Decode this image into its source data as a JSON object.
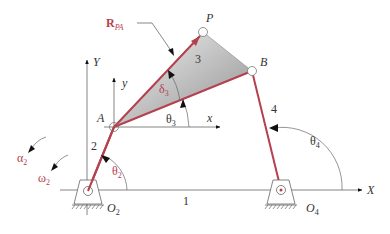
{
  "diagram": {
    "title": "",
    "type": "four-bar linkage with coupler point",
    "colors": {
      "link": "#b5404e",
      "axis": "#555555",
      "coupler_fill_light": "#f2f2f2",
      "coupler_fill_dark": "#9a9a9a",
      "label_dark": "#333333",
      "label_red": "#b5404e"
    },
    "points": {
      "P": {
        "label": "P",
        "x": 203,
        "y": 32
      },
      "B": {
        "label": "B",
        "x": 252,
        "y": 71
      },
      "A": {
        "label": "A",
        "x": 114,
        "y": 127
      },
      "O2": {
        "label": "O",
        "sub": "2",
        "x": 88,
        "y": 191
      },
      "O4": {
        "label": "O",
        "sub": "4",
        "x": 281,
        "y": 190
      }
    },
    "links": {
      "ground": {
        "label": "1"
      },
      "crank": {
        "label": "2"
      },
      "coupler": {
        "label": "3"
      },
      "rocker": {
        "label": "4"
      }
    },
    "axes": {
      "global_x": "X",
      "global_y": "Y",
      "local_x": "x",
      "local_y": "y"
    },
    "angles": {
      "theta2": {
        "sym": "θ",
        "sub": "2"
      },
      "theta3": {
        "sym": "θ",
        "sub": "3"
      },
      "theta4": {
        "sym": "θ",
        "sub": "4"
      },
      "delta3": {
        "sym": "δ",
        "sub": "3"
      },
      "alpha2": {
        "sym": "α",
        "sub": "2"
      },
      "omega2": {
        "sym": "ω",
        "sub": "2"
      }
    },
    "vector": {
      "label": "R",
      "sub": "PA"
    }
  }
}
